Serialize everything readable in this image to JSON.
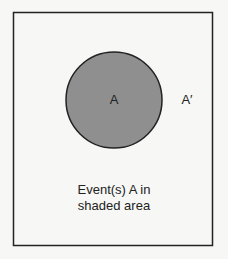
{
  "diagram": {
    "type": "venn",
    "event_label": "A",
    "complement_label": "A′",
    "caption_lines": [
      "Event(s) A in",
      "shaded area"
    ],
    "colors": {
      "background": "#f7f7f5",
      "frame": "#222222",
      "shaded_event": "#8f8f8f",
      "text": "#222222"
    }
  }
}
